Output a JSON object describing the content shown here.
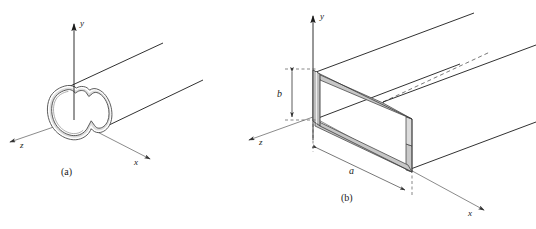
{
  "figure": {
    "background_color": "#ffffff",
    "line_color": "#1a1a1a",
    "wall_fill_color": "#c9c9c9",
    "wall_fill_light": "#e2e2e2",
    "dimension_line_color": "#555555",
    "width_px": 536,
    "height_px": 229
  },
  "panels": [
    {
      "id": "a",
      "caption": "(a)",
      "description": "Hollow waveguide of arbitrary closed cross section",
      "axes": [
        {
          "name": "y",
          "label": "y"
        },
        {
          "name": "x",
          "label": "x"
        },
        {
          "name": "z",
          "label": "z"
        }
      ]
    },
    {
      "id": "b",
      "caption": "(b)",
      "description": "Rectangular waveguide of width a and height b",
      "axes": [
        {
          "name": "y",
          "label": "y"
        },
        {
          "name": "x",
          "label": "x"
        },
        {
          "name": "z",
          "label": "z"
        }
      ],
      "dimensions": [
        {
          "name": "width",
          "label": "a"
        },
        {
          "name": "height",
          "label": "b"
        }
      ]
    }
  ]
}
